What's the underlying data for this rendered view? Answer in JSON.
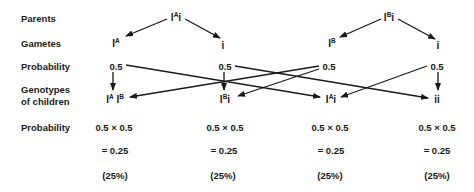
{
  "row_labels": {
    "parents": "Parents",
    "gametes": "Gametes",
    "probability_gametes": "Probability",
    "genotypes_line1": "Genotypes",
    "genotypes_line2": "of children",
    "probability_children": "Probability"
  },
  "parents": [
    {
      "base": "I",
      "sup": "A",
      "tail": "i"
    },
    {
      "base": "I",
      "sup": "B",
      "tail": "i"
    }
  ],
  "gametes": [
    {
      "base": "I",
      "sup": "A",
      "tail": ""
    },
    {
      "base": "i",
      "sup": "",
      "tail": ""
    },
    {
      "base": "I",
      "sup": "B",
      "tail": ""
    },
    {
      "base": "i",
      "sup": "",
      "tail": ""
    }
  ],
  "gamete_probabilities": [
    "0.5",
    "0.5",
    "0.5",
    "0.5"
  ],
  "children": [
    {
      "g1": "I",
      "s1": "A",
      "g2": "I",
      "s2": "B",
      "product": "0.5 × 0.5",
      "result": "= 0.25",
      "percent": "(25%)"
    },
    {
      "g1": "I",
      "s1": "B",
      "g2": "i",
      "s2": "",
      "product": "0.5 × 0.5",
      "result": "= 0.25",
      "percent": "(25%)"
    },
    {
      "g1": "I",
      "s1": "A",
      "g2": "i",
      "s2": "",
      "product": "0.5 × 0.5",
      "result": "= 0.25",
      "percent": "(25%)"
    },
    {
      "g1": "i",
      "s1": "",
      "g2": "i",
      "s2": "",
      "product": "0.5 × 0.5",
      "result": "= 0.25",
      "percent": "(25%)"
    }
  ],
  "colors": {
    "ink": "#1a1a1a",
    "background": "#ffffff"
  }
}
